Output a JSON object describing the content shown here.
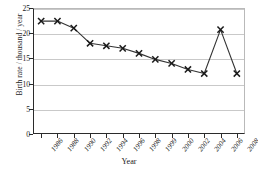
{
  "chart_data": {
    "type": "line",
    "title": "",
    "xlabel": "Year",
    "ylabel": "Birth rate / thousand / year",
    "categories": [
      "1986",
      "1988",
      "1990",
      "1992",
      "1994",
      "1996",
      "1998",
      "1999",
      "2000",
      "2002",
      "2004",
      "2006",
      "2008"
    ],
    "values": [
      22.4,
      22.4,
      21.0,
      18.0,
      17.5,
      17.0,
      16.0,
      14.8,
      14.0,
      12.8,
      12.0,
      20.7,
      12.0
    ],
    "ylim": [
      0,
      25
    ],
    "yticks": [
      "0",
      "5",
      "10",
      "15",
      "20",
      "25"
    ],
    "ytick_values": [
      0,
      5,
      10,
      15,
      20,
      25
    ],
    "grid": "horizontal",
    "legend": "none",
    "marker": "x",
    "line_color": "#333333",
    "marker_color": "#1a1a1a",
    "grid_color": "#c9c9c9",
    "axis_color": "#2b2b2b"
  }
}
